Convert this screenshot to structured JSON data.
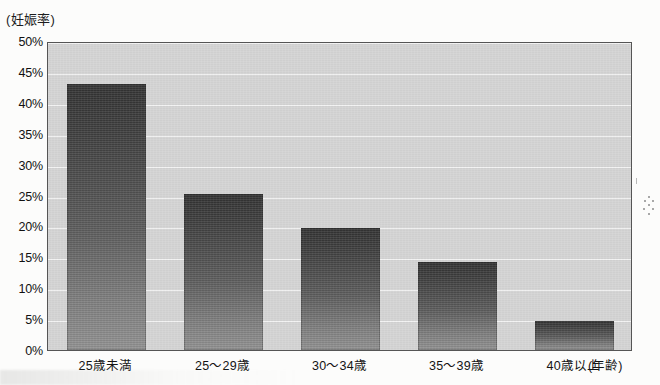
{
  "chart_data": {
    "type": "bar",
    "title": "",
    "categories": [
      "25歳未満",
      "25～29歳",
      "30～34歳",
      "35～39歳",
      "40歳以上"
    ],
    "values": [
      43.0,
      25.3,
      19.8,
      14.3,
      4.7
    ],
    "xlabel": "(年齢)",
    "ylabel": "(妊娠率)",
    "ylim": [
      0,
      50
    ],
    "ytick_labels": [
      "50%",
      "45%",
      "40%",
      "35%",
      "30%",
      "25%",
      "20%",
      "15%",
      "10%",
      "5%",
      "0%"
    ],
    "ytick_values": [
      50,
      45,
      40,
      35,
      30,
      25,
      20,
      15,
      10,
      5,
      0
    ],
    "grid": true,
    "legend": "none",
    "series": [
      {
        "name": "妊娠率",
        "values": [
          43.0,
          25.3,
          19.8,
          14.3,
          4.7
        ]
      }
    ]
  },
  "axes": {
    "y_caption": "(妊娠率)",
    "x_caption": "(年齢)"
  },
  "colors": {
    "plot_background": "#d4d4d4",
    "plot_border": "#555555",
    "bar_top": "#333333",
    "bar_bottom": "#909090",
    "gridline": "#ffffff",
    "text": "#141414",
    "page_background": "#fcfcfb"
  }
}
